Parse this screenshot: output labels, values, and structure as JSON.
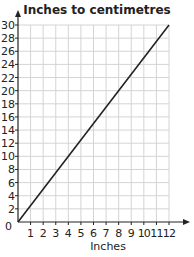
{
  "chart_data": {
    "type": "line",
    "title": "Inches to centimetres",
    "xlabel": "Inches",
    "ylabel": "",
    "xlim": [
      0,
      12
    ],
    "ylim": [
      0,
      30
    ],
    "x_ticks": [
      0,
      1,
      2,
      3,
      4,
      5,
      6,
      7,
      8,
      9,
      10,
      11,
      12
    ],
    "y_ticks": [
      0,
      2,
      4,
      6,
      8,
      10,
      12,
      14,
      16,
      18,
      20,
      22,
      24,
      26,
      28,
      30
    ],
    "grid": true,
    "series": [
      {
        "name": "centimetres",
        "x": [
          0,
          12
        ],
        "values": [
          0,
          30
        ]
      }
    ]
  },
  "colors": {
    "line": "#222222",
    "grid": "#d4d4d4",
    "axis": "#222222",
    "background": "#ffffff"
  }
}
